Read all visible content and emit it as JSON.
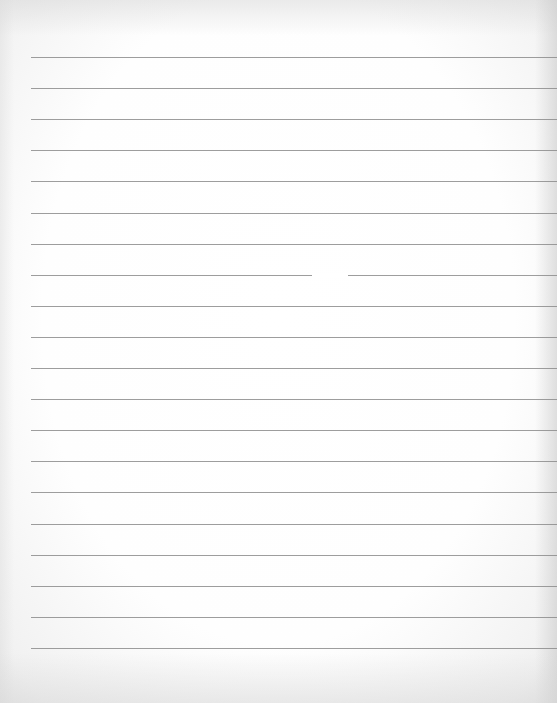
{
  "page": {
    "type": "blank-lined-paper",
    "line_count": 20,
    "first_line_y": 57,
    "line_spacing": 31.1,
    "line_left": 31,
    "line_color": "#8c8c8c",
    "background_color": "#fdfdfd"
  }
}
